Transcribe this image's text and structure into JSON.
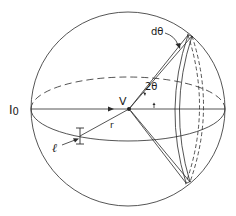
{
  "figure": {
    "labels": {
      "incident_intensity": "I",
      "incident_subscript": "0",
      "volume": "V",
      "radius": "r",
      "length": "ℓ",
      "scattering_angle": "2θ",
      "angular_width": "dθ"
    },
    "colors": {
      "line": "#2a2a2a",
      "background": "#ffffff",
      "text": "#1a1a1a"
    }
  }
}
